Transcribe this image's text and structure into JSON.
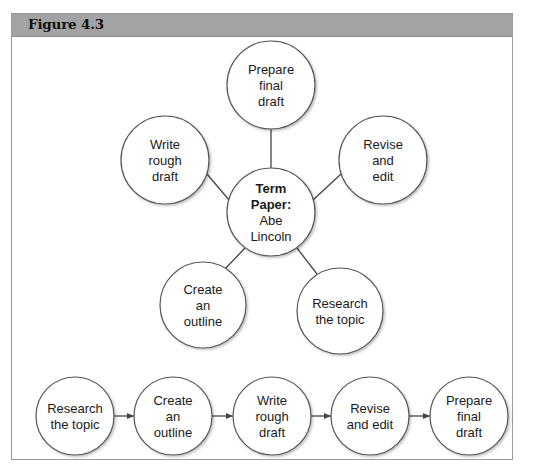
{
  "figure": {
    "title": "Figure 4.3"
  },
  "web_diagram": {
    "center": {
      "lines": [
        "Term",
        "Paper:",
        "Abe",
        "Lincoln"
      ],
      "bold_lines": 2
    },
    "spokes": [
      {
        "id": "prepare-final-draft",
        "lines": [
          "Prepare",
          "final",
          "draft"
        ]
      },
      {
        "id": "write-rough-draft",
        "lines": [
          "Write",
          "rough",
          "draft"
        ]
      },
      {
        "id": "revise-and-edit",
        "lines": [
          "Revise",
          "and",
          "edit"
        ]
      },
      {
        "id": "create-an-outline",
        "lines": [
          "Create",
          "an",
          "outline"
        ]
      },
      {
        "id": "research-the-topic",
        "lines": [
          "Research",
          "the topic"
        ]
      }
    ]
  },
  "flow_diagram": {
    "steps": [
      {
        "id": "research-the-topic",
        "lines": [
          "Research",
          "the topic"
        ]
      },
      {
        "id": "create-an-outline",
        "lines": [
          "Create",
          "an",
          "outline"
        ]
      },
      {
        "id": "write-rough-draft",
        "lines": [
          "Write",
          "rough",
          "draft"
        ]
      },
      {
        "id": "revise-and-edit",
        "lines": [
          "Revise",
          "and edit"
        ]
      },
      {
        "id": "prepare-final-draft",
        "lines": [
          "Prepare",
          "final",
          "draft"
        ]
      }
    ]
  },
  "colors": {
    "header_bg": "#a3a3a3",
    "frame_border": "#9a9a9a",
    "circle_stroke": "#555555",
    "connector": "#444444"
  }
}
